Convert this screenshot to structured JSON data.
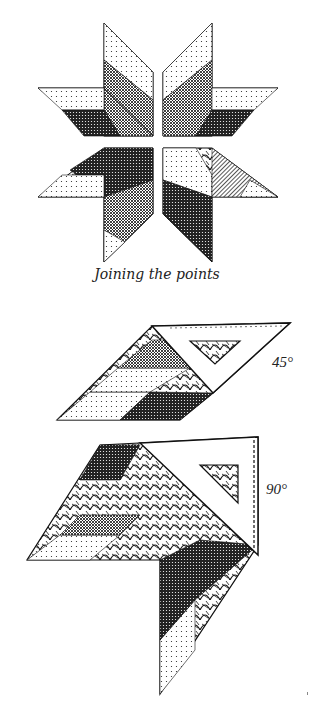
{
  "figure": {
    "caption": "Joining the points",
    "star": {
      "sections": [
        "top-left",
        "top-right",
        "bottom-left",
        "bottom-right"
      ],
      "section_count": 4
    },
    "diagrams": [
      {
        "id": "ruler-45",
        "label": "45°",
        "tool": "triangle ruler"
      },
      {
        "id": "ruler-90",
        "label": "90°",
        "tool": "triangle ruler"
      }
    ],
    "colors": {
      "ink": "#111111",
      "paper": "#ffffff",
      "mid": "#555555"
    }
  }
}
